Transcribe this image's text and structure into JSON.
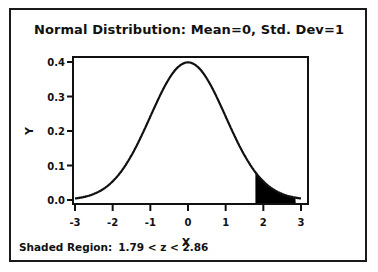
{
  "chart_data": {
    "type": "line",
    "title": "Normal Distribution:  Mean=0, Std. Dev=1",
    "xlabel": "X",
    "ylabel": "Y",
    "xlim": [
      -3,
      3
    ],
    "ylim": [
      0.0,
      0.4
    ],
    "x_ticks": [
      "-3",
      "-2",
      "-1",
      "0",
      "1",
      "2",
      "3"
    ],
    "y_ticks": [
      "0.0",
      "0.1",
      "0.2",
      "0.3",
      "0.4"
    ],
    "grid": false,
    "legend": null,
    "series": [
      {
        "name": "Normal PDF (mean=0, sd=1)",
        "x": [
          -3,
          -2.5,
          -2,
          -1.5,
          -1,
          -0.5,
          0,
          0.5,
          1,
          1.5,
          2,
          2.5,
          3
        ],
        "y": [
          0.004,
          0.018,
          0.054,
          0.13,
          0.242,
          0.352,
          0.399,
          0.352,
          0.242,
          0.13,
          0.054,
          0.018,
          0.004
        ]
      }
    ],
    "shaded_region": {
      "z_low": 1.79,
      "z_high": 2.86,
      "color": "#000000"
    },
    "annotation": "Shaded Region:  1.79 < z < 2.86"
  },
  "footer": {
    "label": "Shaded Region:",
    "range": "1.79 < z < 2.86"
  }
}
